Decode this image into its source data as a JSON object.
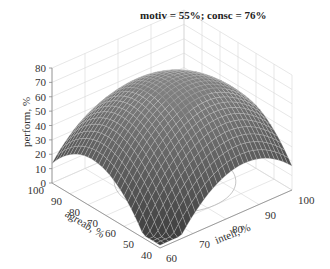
{
  "chart_data": {
    "type": "surface3d",
    "title": "motiv = 55%; consc = 76%",
    "xlabel": "intell, %",
    "ylabel": "agreab, %",
    "zlabel": "perform, %",
    "x_ticks": [
      60,
      70,
      80,
      90,
      100
    ],
    "y_ticks": [
      40,
      50,
      60,
      70,
      80,
      90,
      100
    ],
    "z_ticks": [
      0,
      10,
      20,
      30,
      40,
      50,
      60,
      70,
      80
    ],
    "xlim": [
      60,
      100
    ],
    "ylim": [
      40,
      100
    ],
    "zlim": [
      0,
      80
    ],
    "grid": true,
    "colormap": "gray",
    "surface": {
      "shape": "concave-down paraboloid",
      "peak_value": 72,
      "peak_at": {
        "intell": 82,
        "agreab": 72
      },
      "corner_values": {
        "intell60_agreab100": 30,
        "intell60_agreab40": 3,
        "intell100_agreab40": 20,
        "intell100_agreab100": 25
      }
    },
    "floor_contour": "ellipse projection on z=0 plane"
  },
  "header": {
    "title": "motiv = 55%; consc = 76%"
  },
  "axes": {
    "z_label": "perform, %",
    "y_label": "agreab, %",
    "x_label": "intell, %",
    "z_ticks": [
      "0",
      "10",
      "20",
      "30",
      "40",
      "50",
      "60",
      "70",
      "80"
    ],
    "y_ticks": [
      "100",
      "90",
      "80",
      "70",
      "60",
      "50",
      "40"
    ],
    "x_ticks": [
      "60",
      "70",
      "80",
      "90",
      "100"
    ]
  }
}
